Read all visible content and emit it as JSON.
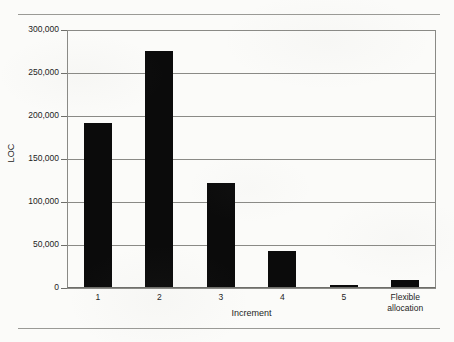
{
  "figure": {
    "background_color": "#fbfbf9",
    "rule_color": "#9a9a96",
    "bar_color": "#0b0b0b",
    "grid_color": "#8a8a86"
  },
  "chart_data": {
    "type": "bar",
    "title": "",
    "xlabel": "Increment",
    "ylabel": "LOC",
    "categories": [
      "1",
      "2",
      "3",
      "4",
      "5",
      "Flexible allocation"
    ],
    "category_lines": [
      [
        "1"
      ],
      [
        "2"
      ],
      [
        "3"
      ],
      [
        "4"
      ],
      [
        "5"
      ],
      [
        "Flexible",
        "allocation"
      ]
    ],
    "values": [
      192000,
      276000,
      122000,
      43000,
      3500,
      9000
    ],
    "ylim": [
      0,
      300000
    ],
    "ytick_values": [
      0,
      50000,
      100000,
      150000,
      200000,
      250000,
      300000
    ],
    "ytick_labels": [
      "0",
      "50,000",
      "100,000",
      "150,000",
      "200,000",
      "250,000",
      "300,000"
    ],
    "grid": true,
    "grid_axis": "y",
    "legend": null,
    "legend_position": "none",
    "bar_color": "#0b0b0b"
  }
}
